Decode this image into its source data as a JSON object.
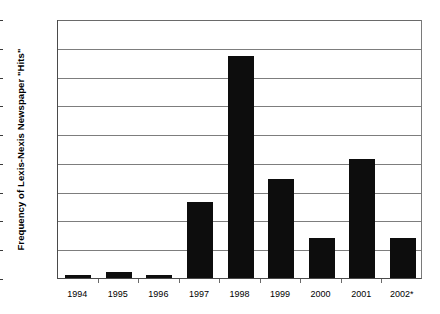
{
  "chart_data": {
    "type": "bar",
    "title": "",
    "xlabel": "",
    "ylabel": "Frequency of Lexis-Nexis Newspaper \"Hits\"",
    "categories": [
      "1994",
      "1995",
      "1996",
      "1997",
      "1998",
      "1999",
      "2000",
      "2001",
      "2002*"
    ],
    "values": [
      12,
      22,
      10,
      265,
      770,
      345,
      140,
      415,
      140
    ],
    "ylim": [
      0,
      900
    ],
    "ytick_labels": [
      "0",
      "100",
      "200",
      "300",
      "400",
      "500",
      "600",
      "700",
      "800",
      "900"
    ],
    "ytick_values": [
      0,
      100,
      200,
      300,
      400,
      500,
      600,
      700,
      800,
      900
    ],
    "grid": true,
    "legend": "none",
    "bar_color": "#0d0d0d",
    "grid_color": "#7d7d7d",
    "axis_color": "#4a4a4a",
    "background_color": "#ffffff"
  }
}
